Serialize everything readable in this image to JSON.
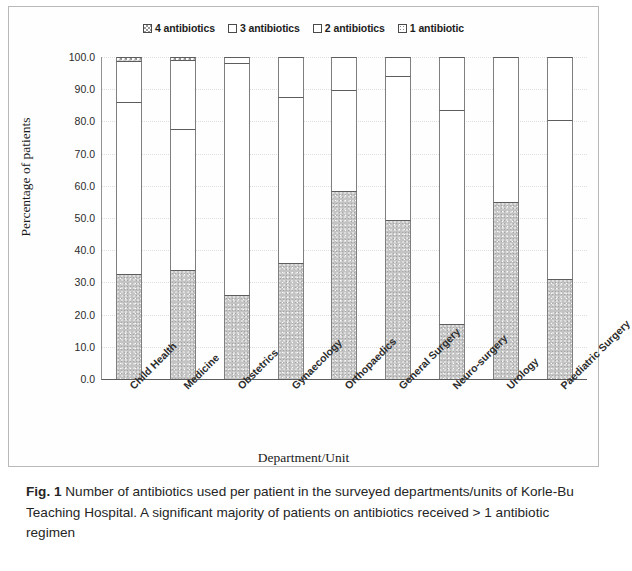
{
  "figure": {
    "caption_label": "Fig. 1",
    "caption_text": " Number of antibiotics used per patient in the surveyed departments/units of Korle-Bu Teaching Hospital. A significant majority of patients on antibiotics received > 1 antibiotic regimen"
  },
  "chart_data": {
    "type": "bar",
    "subtype": "stacked-100-percent",
    "title": "",
    "xlabel": "Department/Unit",
    "ylabel": "Percentage of patients",
    "ylim": [
      0,
      100
    ],
    "ytick_step": 10,
    "ytick_labels": [
      "100.0",
      "90.0",
      "80.0",
      "70.0",
      "60.0",
      "50.0",
      "40.0",
      "30.0",
      "20.0",
      "10.0",
      "0.0"
    ],
    "grid": true,
    "legend_position": "top-center",
    "stack_order_bottom_to_top": [
      "1 antibiotic",
      "2 antibiotics",
      "3 antibiotics",
      "4 antibiotics"
    ],
    "categories": [
      "Child Health",
      "Medicine",
      "Obstetrics",
      "Gynaecology",
      "Orthopaedics",
      "General Surgery",
      "Neuro-surgery",
      "Urology",
      "Paediatric Surgery"
    ],
    "series": [
      {
        "name": "1 antibiotic",
        "pattern": "stipple-grey",
        "values": [
          32.5,
          34.0,
          26.0,
          36.0,
          58.5,
          49.3,
          17.0,
          55.0,
          31.0
        ]
      },
      {
        "name": "2 antibiotics",
        "pattern": "white",
        "values": [
          53.5,
          43.5,
          72.0,
          51.5,
          31.2,
          44.7,
          66.5,
          45.0,
          49.5
        ]
      },
      {
        "name": "3 antibiotics",
        "pattern": "white",
        "values": [
          12.7,
          21.5,
          2.0,
          12.5,
          10.3,
          6.0,
          16.5,
          0.0,
          19.5
        ]
      },
      {
        "name": "4 antibiotics",
        "pattern": "checker-grey",
        "values": [
          1.3,
          1.0,
          0.0,
          0.0,
          0.0,
          0.0,
          0.0,
          0.0,
          0.0
        ]
      }
    ],
    "cumulative_tops": {
      "1 antibiotic": [
        32.5,
        34.0,
        26.0,
        36.0,
        58.5,
        49.3,
        17.0,
        55.0,
        31.0
      ],
      "2 antibiotics": [
        86.0,
        77.5,
        98.0,
        87.5,
        89.7,
        94.0,
        83.5,
        100.0,
        80.5
      ],
      "3 antibiotics": [
        98.7,
        99.0,
        100.0,
        100.0,
        100.0,
        100.0,
        100.0,
        100.0,
        100.0
      ],
      "4 antibiotics": [
        100.0,
        100.0,
        100.0,
        100.0,
        100.0,
        100.0,
        100.0,
        100.0,
        100.0
      ]
    }
  },
  "legend": {
    "items": [
      {
        "label": "4 antibiotics",
        "swatch": "pat-check"
      },
      {
        "label": "3 antibiotics",
        "swatch": "plain"
      },
      {
        "label": "2 antibiotics",
        "swatch": "plain"
      },
      {
        "label": "1 antibiotic",
        "swatch": "pat-dots"
      }
    ]
  }
}
